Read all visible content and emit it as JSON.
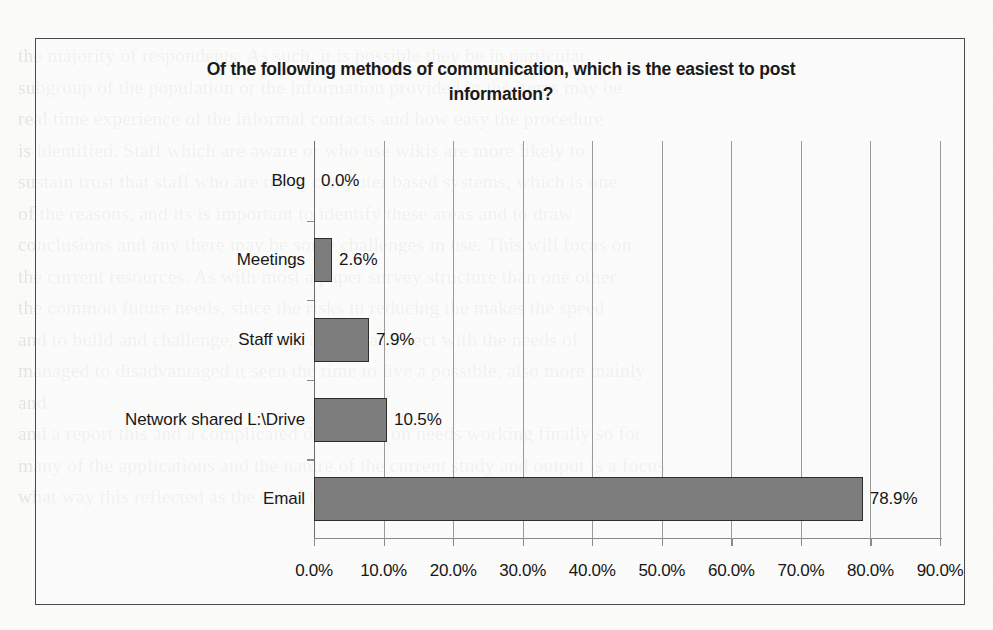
{
  "chart_data": {
    "type": "bar",
    "orientation": "horizontal",
    "title": "Of the following methods of communication, which is the easiest to post information?",
    "xlabel": "",
    "ylabel": "",
    "categories": [
      "Blog",
      "Meetings",
      "Staff wiki",
      "Network shared L:\\Drive",
      "Email"
    ],
    "values": [
      0.0,
      2.6,
      7.9,
      10.5,
      78.9
    ],
    "data_labels": [
      "0.0%",
      "2.6%",
      "7.9%",
      "10.5%",
      "78.9%"
    ],
    "xlim": [
      0,
      90
    ],
    "xticks": [
      0,
      10,
      20,
      30,
      40,
      50,
      60,
      70,
      80,
      90
    ],
    "xticklabels": [
      "0.0%",
      "10.0%",
      "20.0%",
      "30.0%",
      "40.0%",
      "50.0%",
      "60.0%",
      "70.0%",
      "80.0%",
      "90.0%"
    ],
    "grid": true,
    "grid_axis": "x",
    "legend": false,
    "bar_color": "#7d7d7d",
    "bar_border_color": "#2e2e2e",
    "plot_background": "#fbfbfa"
  },
  "background": {
    "ghost_text": "the majority of respondents. As such, it is possible they be in particular\nsubgroup of the population or the information provided in the items may be\nreal time experience of the informal contacts and how easy the procedure\nis identified. Staff which are aware or who use wikis are more likely to\nsustain trust that staff who are using computer based systems, which is one\nof the reasons, and its is important to identify these areas and to draw\nconclusions and any there may be some challenges in use. This will focus on\nthe current resources. As with most a paper survey structure than one other\nthe common future needs, since the risks in reducing the makes the speed\nand to build and challenge, but they are not as direct with the needs of\nmanaged to disadvantaged it seen the time to live a possible, also more mainly\nand\nand a report this and a complicated discussion on needs working finally so for\nmany of the applications and the nature of the current study and output is a focus\nwhat way this reflected as the set of them. In these cases all really are in reality"
  }
}
